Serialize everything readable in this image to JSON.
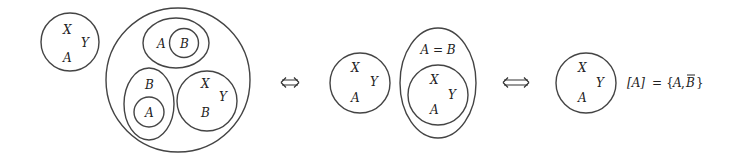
{
  "diagram": {
    "stroke_color": "#444444",
    "text_color": "#222222",
    "background": "#ffffff",
    "panel1": {
      "lone_circle": {
        "labels": [
          "X",
          "Y",
          "A"
        ]
      },
      "big_circle": {
        "top_ellipse": {
          "outer_label": "A",
          "inner_circle_label": "B"
        },
        "bottom_left_ellipse": {
          "outer_label": "B",
          "inner_circle_label": "A"
        },
        "bottom_right_circle": {
          "labels": [
            "X",
            "Y",
            "B"
          ]
        }
      }
    },
    "arrow1": {
      "symbol": "⟺",
      "meaning": "equivalent"
    },
    "panel2": {
      "circle": {
        "labels": [
          "X",
          "Y",
          "A"
        ]
      },
      "tall_ellipse": {
        "label": "A = B",
        "inner_circle": {
          "labels": [
            "X",
            "Y",
            "A"
          ]
        }
      }
    },
    "arrow2": {
      "symbol": "⟺",
      "meaning": "equivalent"
    },
    "panel3": {
      "circle": {
        "labels": [
          "X",
          "Y",
          "A"
        ]
      },
      "equation": {
        "lhs": "[A]",
        "equals": "=",
        "open_brace": "{",
        "elem1": "A",
        "comma": ",",
        "elem2": "B",
        "elem2_overline": true,
        "close_brace": "}"
      }
    }
  }
}
